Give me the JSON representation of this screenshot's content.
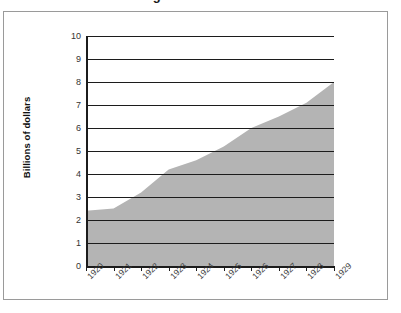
{
  "title_remnant": "Selling",
  "figure": {
    "frame_border_color": "#9a9a9a",
    "background": "#ffffff"
  },
  "chart_data": {
    "type": "area",
    "title": "",
    "xlabel": "",
    "ylabel": "Billions of dollars",
    "x": [
      "1920",
      "1921",
      "1922",
      "1923",
      "1924",
      "1925",
      "1926",
      "1927",
      "1928",
      "1929"
    ],
    "values": [
      2.4,
      2.5,
      3.2,
      4.2,
      4.6,
      5.2,
      6.0,
      6.5,
      7.1,
      8.0
    ],
    "ylim": [
      0,
      10
    ],
    "yticks": [
      0,
      1,
      2,
      3,
      4,
      5,
      6,
      7,
      8,
      9,
      10
    ],
    "ytick_labels": [
      "0",
      "1",
      "2",
      "3",
      "4",
      "5",
      "6",
      "7",
      "8",
      "9",
      "10"
    ],
    "xtick_labels": [
      "1920",
      "1921",
      "1922",
      "1923",
      "1924",
      "1925",
      "1926",
      "1927",
      "1928",
      "1929"
    ],
    "grid": true,
    "grid_axis": "y",
    "legend": "none",
    "area_fill_color": "#b4b4b4",
    "gridline_color": "#1c1c1c",
    "axis_color": "#1c1c1c"
  }
}
